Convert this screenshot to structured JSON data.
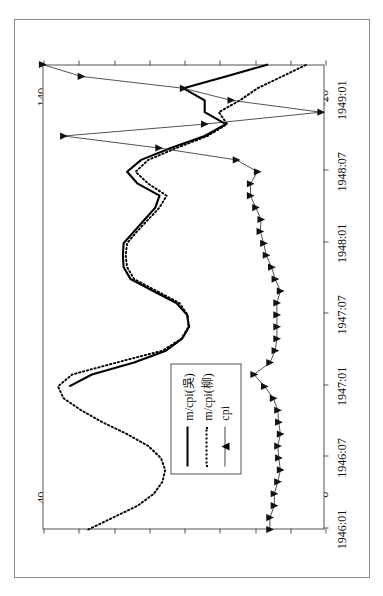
{
  "figure": {
    "frame_color": "#8a8a8a",
    "background": "#ffffff"
  },
  "legend": {
    "position": "inside-left-middle",
    "entries": [
      {
        "label": "m/cpi(吳)",
        "style": "solid",
        "marker": "none",
        "color": "#000000"
      },
      {
        "label": "m/cpi(柳)",
        "style": "dotted",
        "marker": "none",
        "color": "#000000"
      },
      {
        "label": "cpi",
        "style": "thin",
        "marker": "triangle",
        "color": "#333333"
      }
    ]
  },
  "chart_data": {
    "type": "line",
    "title": "",
    "subtitle": "",
    "xlabel": "",
    "ylabel": "",
    "grid": false,
    "orientation": "rotated-90-ccw",
    "legend_position": "inside left",
    "x": [
      "1946:01",
      "1946:02",
      "1946:03",
      "1946:04",
      "1946:05",
      "1946:06",
      "1946:07",
      "1946:08",
      "1946:09",
      "1946:10",
      "1946:11",
      "1946:12",
      "1947:01",
      "1947:02",
      "1947:03",
      "1947:04",
      "1947:05",
      "1947:06",
      "1947:07",
      "1947:08",
      "1947:09",
      "1947:10",
      "1947:11",
      "1947:12",
      "1948:01",
      "1948:02",
      "1948:03",
      "1948:04",
      "1948:05",
      "1948:06",
      "1948:07",
      "1948:08",
      "1948:09",
      "1948:10",
      "1948:11",
      "1948:12",
      "1949:01",
      "1949:02",
      "1949:03",
      "1949:04"
    ],
    "xticks": [
      "1946:01",
      "1946:07",
      "1947:01",
      "1947:07",
      "1948:01",
      "1948:07",
      "1949:01"
    ],
    "xtick_index": [
      0,
      6,
      12,
      18,
      24,
      30,
      36
    ],
    "axes": {
      "left": {
        "label": "",
        "ticks": [
          0,
          5,
          10,
          15,
          20,
          25,
          30,
          35,
          40
        ],
        "min": 0,
        "max": 40,
        "series": [
          "m/cpi(吳)",
          "m/cpi(柳)"
        ]
      },
      "right": {
        "label": "",
        "ticks": [
          -20,
          0,
          20,
          40,
          60,
          80,
          100,
          120,
          140
        ],
        "min": -20,
        "max": 140,
        "series": [
          "cpi"
        ]
      }
    },
    "series": [
      {
        "name": "m/cpi(吳)",
        "axis": "left",
        "style": "solid",
        "color": "#000000",
        "values": [
          null,
          null,
          null,
          null,
          null,
          null,
          null,
          null,
          null,
          null,
          null,
          null,
          36.2,
          33.0,
          27.0,
          22.5,
          20.2,
          19.2,
          19.5,
          21.0,
          24.3,
          27.5,
          28.5,
          28.6,
          28.5,
          27.0,
          25.5,
          24.0,
          23.4,
          26.5,
          28.0,
          26.0,
          21.8,
          17.0,
          14.0,
          17.0,
          17.0,
          20.0,
          14.0,
          8.0
        ]
      },
      {
        "name": "m/cpi(柳)",
        "axis": "left",
        "style": "dotted",
        "color": "#000000",
        "values": [
          33.5,
          30.0,
          26.5,
          24.2,
          23.0,
          22.6,
          23.2,
          25.0,
          28.0,
          31.5,
          34.5,
          37.0,
          37.8,
          35.8,
          29.5,
          23.0,
          20.3,
          19.3,
          19.4,
          20.6,
          23.8,
          27.0,
          28.0,
          28.2,
          28.0,
          26.6,
          25.0,
          23.4,
          22.4,
          25.0,
          26.8,
          25.0,
          21.0,
          16.6,
          13.8,
          15.0,
          12.0,
          9.5,
          6.0,
          2.5
        ]
      },
      {
        "name": "cpi",
        "axis": "right",
        "style": "thin-marker",
        "marker": "triangle",
        "color": "#333333",
        "values": [
          11.0,
          11.0,
          8.5,
          8.5,
          6.5,
          5.0,
          6.0,
          6.5,
          5.0,
          6.0,
          6.5,
          9.0,
          14.0,
          20.0,
          11.0,
          8.0,
          7.0,
          7.0,
          7.0,
          7.0,
          5.0,
          8.0,
          10.0,
          13.0,
          14.5,
          16.5,
          16.0,
          19.0,
          22.0,
          22.0,
          18.0,
          30.0,
          74.0,
          128.0,
          48.0,
          -18.0,
          33.0,
          60.0,
          118.0,
          140.0
        ]
      }
    ]
  }
}
